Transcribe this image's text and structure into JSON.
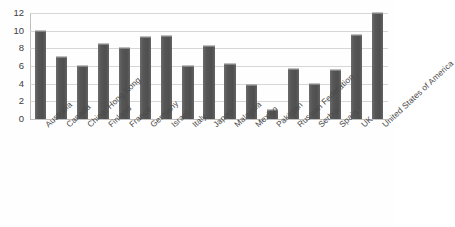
{
  "chart_data": {
    "type": "bar",
    "title": "",
    "subtitle": "",
    "xlabel": "",
    "ylabel": "",
    "ylim": [
      0,
      12
    ],
    "ytick_values": [
      0,
      2,
      4,
      6,
      8,
      10,
      12
    ],
    "ytick_labels": [
      "0",
      "2",
      "4",
      "6",
      "8",
      "10",
      "12"
    ],
    "grid": true,
    "legend": false,
    "legend_position": "none",
    "bar_color": "#565656",
    "gridline_color": "#d6d6d6",
    "axis_text_color": "#404040",
    "categories": [
      "Australia",
      "Canada",
      "China, Hong Kong",
      "Finland",
      "France",
      "Germany",
      "Israel",
      "Italy",
      "Japan",
      "Malaysia",
      "Mexico",
      "Pakistan",
      "Russian Federation",
      "Serbia",
      "Spain",
      "UK",
      "United States of America"
    ],
    "values": [
      10,
      7,
      6,
      8.5,
      8,
      9.3,
      9.4,
      6,
      8.3,
      6.2,
      3.8,
      1,
      5.7,
      4,
      5.5,
      9.5,
      12
    ]
  }
}
